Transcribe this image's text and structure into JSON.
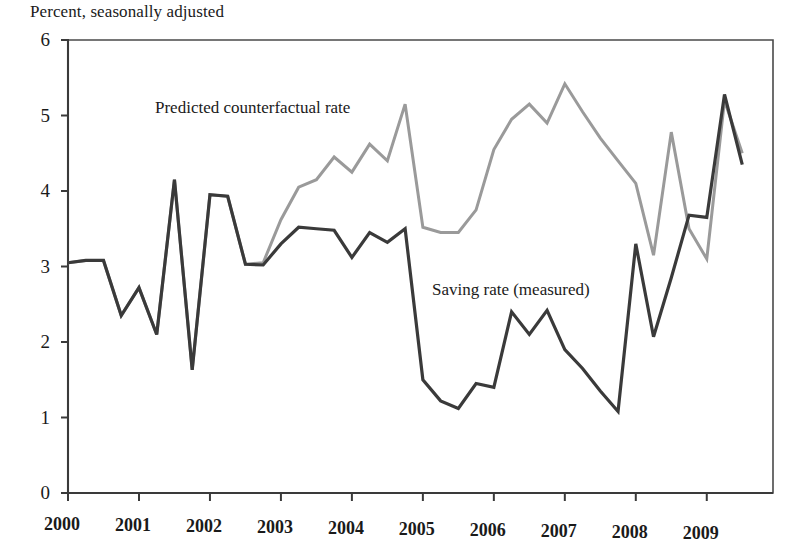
{
  "chart_data": {
    "type": "line",
    "title": "Percent, seasonally adjusted",
    "xlabel": "",
    "ylabel": "Percent, seasonally adjusted",
    "xlim": [
      2000.0,
      2009.75
    ],
    "ylim": [
      0,
      6
    ],
    "yticks": [
      0,
      1,
      2,
      3,
      4,
      5,
      6
    ],
    "ytick_labels": [
      "0",
      "1",
      "2",
      "3",
      "4",
      "5",
      "6"
    ],
    "xticks": [
      2000,
      2001,
      2002,
      2003,
      2004,
      2005,
      2006,
      2007,
      2008,
      2009
    ],
    "xtick_labels": [
      "2000",
      "2001",
      "2002",
      "2003",
      "2004",
      "2005",
      "2006",
      "2007",
      "2008",
      "2009"
    ],
    "grid": false,
    "legend_position": "inline-annotations",
    "x": [
      2000.0,
      2000.25,
      2000.5,
      2000.75,
      2001.0,
      2001.25,
      2001.5,
      2001.75,
      2002.0,
      2002.25,
      2002.5,
      2002.75,
      2003.0,
      2003.25,
      2003.5,
      2003.75,
      2004.0,
      2004.25,
      2004.5,
      2004.75,
      2005.0,
      2005.25,
      2005.5,
      2005.75,
      2006.0,
      2006.25,
      2006.5,
      2006.75,
      2007.0,
      2007.25,
      2007.5,
      2007.75,
      2008.0,
      2008.25,
      2008.5,
      2008.75,
      2009.0,
      2009.25,
      2009.5
    ],
    "series": [
      {
        "name": "Saving rate (measured)",
        "color": "#3a3a3a",
        "values": [
          3.05,
          3.08,
          3.08,
          2.35,
          2.72,
          2.1,
          4.15,
          1.63,
          3.95,
          3.93,
          3.03,
          3.02,
          3.3,
          3.52,
          3.5,
          3.48,
          3.12,
          3.45,
          3.32,
          3.5,
          1.5,
          1.22,
          1.12,
          1.45,
          1.4,
          2.4,
          2.1,
          2.42,
          1.9,
          1.65,
          1.35,
          1.08,
          3.3,
          2.07,
          2.85,
          3.68,
          3.65,
          5.28,
          4.35
        ]
      },
      {
        "name": "Predicted counterfactual rate",
        "color": "#9a9a9a",
        "values": [
          3.05,
          3.08,
          3.08,
          2.35,
          2.72,
          2.1,
          4.15,
          1.63,
          3.95,
          3.93,
          3.03,
          3.05,
          3.62,
          4.05,
          4.15,
          4.45,
          4.25,
          4.62,
          4.4,
          5.15,
          3.52,
          3.45,
          3.45,
          3.75,
          4.55,
          4.95,
          5.15,
          4.9,
          5.42,
          5.05,
          4.7,
          4.4,
          4.1,
          3.15,
          4.78,
          3.5,
          3.1,
          5.2,
          4.5
        ]
      }
    ]
  },
  "annotations": {
    "predicted_label": "Predicted counterfactual rate",
    "measured_label": "Saving rate (measured)"
  },
  "axes": {
    "left_axis_name": "percent-axis",
    "bottom_axis_name": "year-axis"
  }
}
